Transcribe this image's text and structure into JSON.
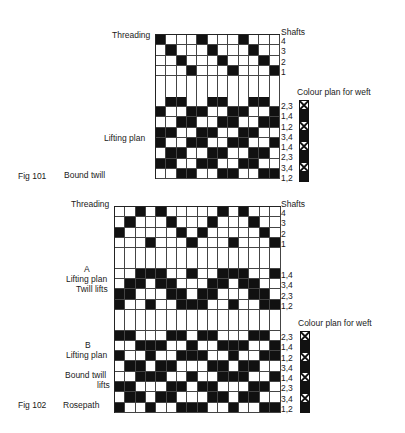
{
  "fig101": {
    "number": "Fig 101",
    "title": "Bound twill",
    "threading_label": "Threading",
    "shafts_label": "Shafts",
    "lifting_label": "Lifting plan",
    "colour_label": "Colour plan for weft",
    "columns": 12,
    "threading": {
      "shafts": [
        "4",
        "3",
        "2",
        "1"
      ],
      "rows": [
        [
          1,
          0,
          0,
          0,
          1,
          0,
          0,
          0,
          1,
          0,
          0,
          0
        ],
        [
          0,
          1,
          0,
          0,
          0,
          1,
          0,
          0,
          0,
          1,
          0,
          0
        ],
        [
          0,
          0,
          1,
          0,
          0,
          0,
          1,
          0,
          0,
          0,
          1,
          0
        ],
        [
          0,
          0,
          0,
          1,
          0,
          0,
          0,
          1,
          0,
          0,
          0,
          1
        ]
      ]
    },
    "lifting": {
      "labels": [
        "2,3",
        "1,4",
        "1,2",
        "3,4",
        "1,4",
        "2,3",
        "3,4",
        "1,2"
      ],
      "rows": [
        [
          0,
          1,
          1,
          0,
          0,
          1,
          1,
          0,
          0,
          1,
          1,
          0
        ],
        [
          1,
          0,
          0,
          1,
          1,
          0,
          0,
          1,
          1,
          0,
          0,
          1
        ],
        [
          0,
          0,
          1,
          1,
          0,
          0,
          1,
          1,
          0,
          0,
          1,
          1
        ],
        [
          1,
          1,
          0,
          0,
          1,
          1,
          0,
          0,
          1,
          1,
          0,
          0
        ],
        [
          1,
          0,
          0,
          1,
          1,
          0,
          0,
          1,
          1,
          0,
          0,
          1
        ],
        [
          0,
          1,
          1,
          0,
          0,
          1,
          1,
          0,
          0,
          1,
          1,
          0
        ],
        [
          1,
          1,
          0,
          0,
          1,
          1,
          0,
          0,
          1,
          1,
          0,
          0
        ],
        [
          0,
          0,
          1,
          1,
          0,
          0,
          1,
          1,
          0,
          0,
          1,
          1
        ]
      ]
    },
    "colour_plan": [
      "x",
      "black",
      "x",
      "black",
      "x",
      "black",
      "x",
      "black"
    ]
  },
  "fig102": {
    "number": "Fig 102",
    "title": "Rosepath",
    "threading_label": "Threading",
    "shafts_label": "Shafts",
    "a_label": "A",
    "a_lifting_label": "Lifting plan",
    "a_sub_label": "Twill lifts",
    "b_label": "B",
    "b_lifting_label": "Lifting plan",
    "b_sub_label_1": "Bound twill",
    "b_sub_label_2": "lifts",
    "colour_label": "Colour plan for weft",
    "columns": 16,
    "threading": {
      "shafts": [
        "4",
        "3",
        "2",
        "1"
      ],
      "rows": [
        [
          0,
          0,
          1,
          0,
          1,
          0,
          0,
          0,
          0,
          0,
          1,
          0,
          1,
          0,
          0,
          0
        ],
        [
          0,
          1,
          0,
          0,
          0,
          1,
          0,
          0,
          0,
          1,
          0,
          0,
          0,
          1,
          0,
          0
        ],
        [
          1,
          0,
          0,
          0,
          0,
          0,
          1,
          0,
          1,
          0,
          0,
          0,
          0,
          0,
          1,
          0
        ],
        [
          0,
          0,
          0,
          1,
          0,
          0,
          0,
          1,
          0,
          0,
          0,
          1,
          0,
          0,
          0,
          1
        ]
      ]
    },
    "lifting_a": {
      "labels": [
        "1,4",
        "3,4",
        "2,3",
        "1,2"
      ],
      "rows": [
        [
          0,
          0,
          1,
          1,
          1,
          0,
          0,
          1,
          0,
          0,
          1,
          1,
          1,
          0,
          0,
          1
        ],
        [
          0,
          1,
          1,
          0,
          1,
          1,
          0,
          0,
          0,
          1,
          1,
          0,
          1,
          1,
          0,
          0
        ],
        [
          1,
          1,
          0,
          0,
          0,
          1,
          1,
          0,
          1,
          1,
          0,
          0,
          0,
          1,
          1,
          0
        ],
        [
          1,
          0,
          0,
          1,
          0,
          0,
          1,
          1,
          1,
          0,
          0,
          1,
          0,
          0,
          1,
          1
        ]
      ]
    },
    "lifting_b": {
      "labels": [
        "2,3",
        "1,4",
        "1,2",
        "3,4",
        "1,4",
        "2,3",
        "3,4",
        "1,2"
      ],
      "rows": [
        [
          1,
          1,
          0,
          0,
          0,
          1,
          1,
          0,
          1,
          1,
          0,
          0,
          0,
          1,
          1,
          0
        ],
        [
          0,
          0,
          1,
          1,
          1,
          0,
          0,
          1,
          0,
          0,
          1,
          1,
          1,
          0,
          0,
          1
        ],
        [
          1,
          0,
          0,
          1,
          0,
          0,
          1,
          1,
          1,
          0,
          0,
          1,
          0,
          0,
          1,
          1
        ],
        [
          0,
          1,
          1,
          0,
          1,
          1,
          0,
          0,
          0,
          1,
          1,
          0,
          1,
          1,
          0,
          0
        ],
        [
          0,
          0,
          1,
          1,
          1,
          0,
          0,
          1,
          0,
          0,
          1,
          1,
          1,
          0,
          0,
          1
        ],
        [
          1,
          1,
          0,
          0,
          0,
          1,
          1,
          0,
          1,
          1,
          0,
          0,
          0,
          1,
          1,
          0
        ],
        [
          0,
          1,
          1,
          0,
          1,
          1,
          0,
          0,
          0,
          1,
          1,
          0,
          1,
          1,
          0,
          0
        ],
        [
          1,
          0,
          0,
          1,
          0,
          0,
          1,
          1,
          1,
          0,
          0,
          1,
          0,
          0,
          1,
          1
        ]
      ]
    },
    "colour_plan": [
      "x",
      "black",
      "x",
      "black",
      "x",
      "black",
      "x",
      "black"
    ]
  }
}
